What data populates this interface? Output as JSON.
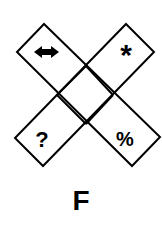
{
  "figure": {
    "type": "x-shaped diamond puzzle",
    "cells": [
      {
        "position": "top-left",
        "symbol": "double-arrow",
        "glyph": "⬌"
      },
      {
        "position": "top-right",
        "symbol": "asterisk",
        "glyph": "*"
      },
      {
        "position": "bottom-left",
        "symbol": "question-mark",
        "glyph": "?"
      },
      {
        "position": "bottom-right",
        "symbol": "percent",
        "glyph": "%"
      },
      {
        "position": "center",
        "symbol": "empty",
        "glyph": ""
      }
    ],
    "stroke_color": "#000000",
    "background": "#ffffff"
  },
  "option_label": "F"
}
